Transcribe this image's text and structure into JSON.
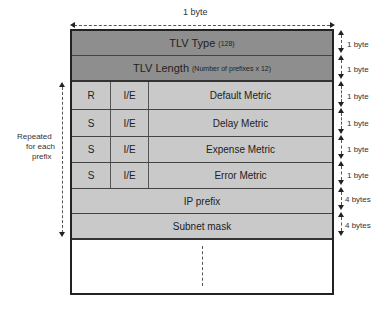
{
  "width_label": "1 byte",
  "rows": {
    "tlv_type": {
      "label": "TLV Type",
      "note": "(128)",
      "size": "1 byte"
    },
    "tlv_length": {
      "label": "TLV Length",
      "note": "(Number of prefixes x 12)",
      "size": "1 byte"
    },
    "default_metric": {
      "bit1": "R",
      "bit2": "I/E",
      "label": "Default Metric",
      "size": "1 byte"
    },
    "delay_metric": {
      "bit1": "S",
      "bit2": "I/E",
      "label": "Delay Metric",
      "size": "1 byte"
    },
    "expense_metric": {
      "bit1": "S",
      "bit2": "I/E",
      "label": "Expense Metric",
      "size": "1 byte"
    },
    "error_metric": {
      "bit1": "S",
      "bit2": "I/E",
      "label": "Error Metric",
      "size": "1 byte"
    },
    "ip_prefix": {
      "label": "IP prefix",
      "size": "4 bytes"
    },
    "subnet_mask": {
      "label": "Subnet mask",
      "size": "4 bytes"
    }
  },
  "repeat_label": {
    "line1": "Repeated",
    "line2": "for each",
    "line3": "prefix"
  },
  "colors": {
    "header": "#8e8e8e",
    "body": "#c9c9c9",
    "border": "#222222"
  }
}
